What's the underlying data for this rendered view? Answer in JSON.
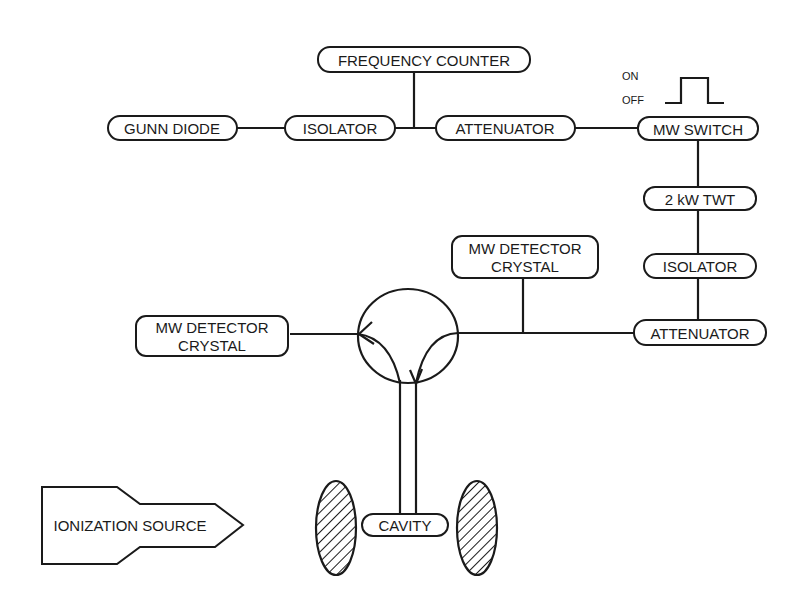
{
  "diagram": {
    "type": "block-diagram",
    "colors": {
      "stroke": "#1a1a1a",
      "background": "#ffffff"
    },
    "nodes": {
      "frequency_counter": "FREQUENCY COUNTER",
      "gunn_diode": "GUNN DIODE",
      "isolator_top": "ISOLATOR",
      "attenuator_top": "ATTENUATOR",
      "mw_switch": "MW SWITCH",
      "twt": "2 kW TWT",
      "isolator_right": "ISOLATOR",
      "attenuator_right": "ATTENUATOR",
      "detector_top_line1": "MW  DETECTOR",
      "detector_top_line2": "CRYSTAL",
      "detector_left_line1": "MW  DETECTOR",
      "detector_left_line2": "CRYSTAL",
      "cavity": "CAVITY",
      "ionization_source": "IONIZATION SOURCE"
    },
    "pulse": {
      "on_label": "ON",
      "off_label": "OFF"
    },
    "components": [
      "circulator",
      "waveguide",
      "magnet-pole-left",
      "magnet-pole-right"
    ]
  }
}
